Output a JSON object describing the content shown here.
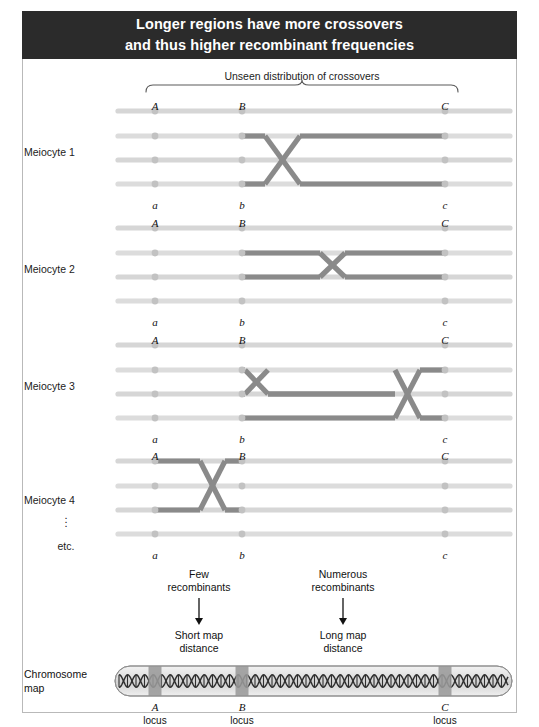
{
  "title": {
    "line1": "Longer regions have more crossovers",
    "line2": "and thus higher recombinant frequencies"
  },
  "colors": {
    "title_bar_bg": "#2b2b2b",
    "title_text": "#ffffff",
    "frame_border": "#b9b9b9",
    "chromatid": "#d6d6d6",
    "chromatid_light": "#dcdcdc",
    "recombinant_segment": "#8a8a8a",
    "locus_dot": "#c2c2c2",
    "chromosome_body": "#d8d8d8",
    "chromosome_band": "#9a9a9a",
    "helix_stroke": "#2f2f2f",
    "arrow": "#111111",
    "brace": "#5a5a5a"
  },
  "top_annotation": {
    "caption": "Unseen distribution of crossovers",
    "brace": {
      "x_start": 146,
      "x_end": 458,
      "peak_x": 302
    }
  },
  "loci": {
    "names_upper": [
      "A",
      "B",
      "C"
    ],
    "names_lower": [
      "a",
      "b",
      "c"
    ],
    "x_positions": [
      155,
      242,
      445
    ],
    "line_start_x": 118,
    "line_end_x": 510
  },
  "meiocytes": [
    {
      "label": "Meiocyte 1",
      "label_y": 152,
      "upper_alleles_y": 100,
      "lower_alleles_y": 199,
      "row_y": [
        111,
        136,
        160,
        184
      ],
      "crossovers": [
        {
          "rows": [
            2,
            4
          ],
          "x_start": 265,
          "x_end": 300,
          "segment_to_x": 445
        }
      ]
    },
    {
      "label": "Meiocyte 2",
      "label_y": 269,
      "upper_alleles_y": 217,
      "lower_alleles_y": 316,
      "row_y": [
        228,
        253,
        277,
        301
      ],
      "crossovers": [
        {
          "rows": [
            2,
            3
          ],
          "x_start": 320,
          "x_end": 345,
          "segment_to_x": 445
        }
      ]
    },
    {
      "label": "Meiocyte 3",
      "label_y": 386,
      "upper_alleles_y": 334,
      "lower_alleles_y": 433,
      "row_y": [
        345,
        370,
        394,
        418
      ],
      "crossovers": [
        {
          "rows": [
            2,
            3
          ],
          "x_start": 245,
          "x_end": 268,
          "segment_to_x": 445
        },
        {
          "rows": [
            2,
            4
          ],
          "x_start": 395,
          "x_end": 420,
          "segment_to_x": 445
        }
      ]
    },
    {
      "label": "Meiocyte 4",
      "label_y": 500,
      "upper_alleles_y": 450,
      "lower_alleles_y": 549,
      "row_y": [
        461,
        486,
        510,
        534
      ],
      "crossovers": [
        {
          "rows": [
            1,
            3
          ],
          "x_start": 200,
          "x_end": 225,
          "segment_to_x": 242
        }
      ]
    }
  ],
  "etc_label": "etc.",
  "annotations": [
    {
      "top_line1": "Few",
      "top_line2": "recombinants",
      "bottom_line1": "Short map",
      "bottom_line2": "distance",
      "x": 199,
      "arrow_y_start": 598,
      "arrow_y_end": 625
    },
    {
      "top_line1": "Numerous",
      "top_line2": "recombinants",
      "bottom_line1": "Long map",
      "bottom_line2": "distance",
      "x": 343,
      "arrow_y_start": 598,
      "arrow_y_end": 625
    }
  ],
  "chromosome_map": {
    "label_line1": "Chromosome",
    "label_line2": "map",
    "x_start": 115,
    "x_end": 512,
    "y_center": 681,
    "height": 30,
    "band_width": 13,
    "loci": [
      {
        "name": "A",
        "sub": "locus",
        "x": 155
      },
      {
        "name": "B",
        "sub": "locus",
        "x": 242
      },
      {
        "name": "C",
        "sub": "locus",
        "x": 445
      }
    ]
  }
}
